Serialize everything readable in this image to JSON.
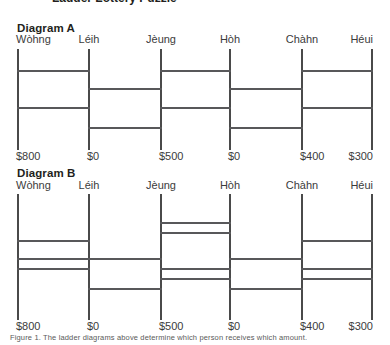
{
  "page": {
    "width": 390,
    "height": 345,
    "background": "#ffffff",
    "line_color": "#58585a",
    "rail_color": "#4a4a4a",
    "text_color": "#231f20",
    "label_color": "#3b3b3b",
    "cropped_heading_above": "Ladder Lottery Puzzle"
  },
  "columns": {
    "x_positions": [
      17,
      88,
      160,
      229,
      301,
      371
    ],
    "names": [
      "Wòhng",
      "Léih",
      "Jèung",
      "Hòh",
      "Chàhn",
      "Héui"
    ],
    "amounts": [
      "$800",
      "$0",
      "$500",
      "$0",
      "$400",
      "$300"
    ]
  },
  "diagrams": [
    {
      "id": "diagram-a",
      "title": "Diagram A",
      "title_y": 22,
      "names_y": 33,
      "rail_top": 49,
      "rail_bottom": 150,
      "amounts_y": 150,
      "rungs": [
        {
          "y": 70,
          "from": 0,
          "to": 1
        },
        {
          "y": 70,
          "from": 2,
          "to": 3
        },
        {
          "y": 70,
          "from": 4,
          "to": 5
        },
        {
          "y": 88,
          "from": 1,
          "to": 2
        },
        {
          "y": 88,
          "from": 3,
          "to": 4
        },
        {
          "y": 107,
          "from": 0,
          "to": 1
        },
        {
          "y": 107,
          "from": 2,
          "to": 3
        },
        {
          "y": 107,
          "from": 4,
          "to": 5
        },
        {
          "y": 127,
          "from": 1,
          "to": 2
        },
        {
          "y": 127,
          "from": 3,
          "to": 4
        }
      ]
    },
    {
      "id": "diagram-b",
      "title": "Diagram B",
      "title_y": 167,
      "names_y": 179,
      "rail_top": 194,
      "rail_bottom": 320,
      "amounts_y": 320,
      "rungs": [
        {
          "y": 222,
          "from": 2,
          "to": 3
        },
        {
          "y": 232,
          "from": 2,
          "to": 3
        },
        {
          "y": 240,
          "from": 0,
          "to": 1
        },
        {
          "y": 240,
          "from": 4,
          "to": 5
        },
        {
          "y": 258,
          "from": 0,
          "to": 1
        },
        {
          "y": 258,
          "from": 1,
          "to": 2
        },
        {
          "y": 258,
          "from": 3,
          "to": 4
        },
        {
          "y": 268,
          "from": 0,
          "to": 1
        },
        {
          "y": 268,
          "from": 2,
          "to": 3
        },
        {
          "y": 268,
          "from": 4,
          "to": 5
        },
        {
          "y": 278,
          "from": 2,
          "to": 3
        },
        {
          "y": 278,
          "from": 4,
          "to": 5
        },
        {
          "y": 288,
          "from": 1,
          "to": 2
        },
        {
          "y": 288,
          "from": 3,
          "to": 4
        }
      ]
    }
  ],
  "caption": {
    "text": "Figure 1.  The ladder diagrams above determine which person receives which amount."
  }
}
